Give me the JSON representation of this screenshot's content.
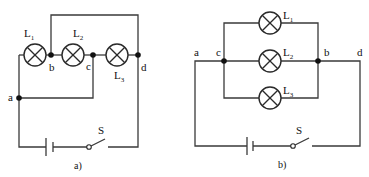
{
  "figure_a": {
    "caption": "a)",
    "lamps": [
      {
        "name": "L",
        "sub": "1"
      },
      {
        "name": "L",
        "sub": "2"
      },
      {
        "name": "L",
        "sub": "3"
      }
    ],
    "nodes": {
      "a": "a",
      "b": "b",
      "c": "c",
      "d": "d"
    },
    "switch_label": "S"
  },
  "figure_b": {
    "caption": "b)",
    "lamps": [
      {
        "name": "L",
        "sub": "1"
      },
      {
        "name": "L",
        "sub": "2"
      },
      {
        "name": "L",
        "sub": "3"
      }
    ],
    "nodes": {
      "a": "a",
      "b": "b",
      "c": "c",
      "d": "d"
    },
    "switch_label": "S"
  },
  "colors": {
    "wire": "#3a3a3a",
    "node": "#111111",
    "background": "#ffffff"
  }
}
